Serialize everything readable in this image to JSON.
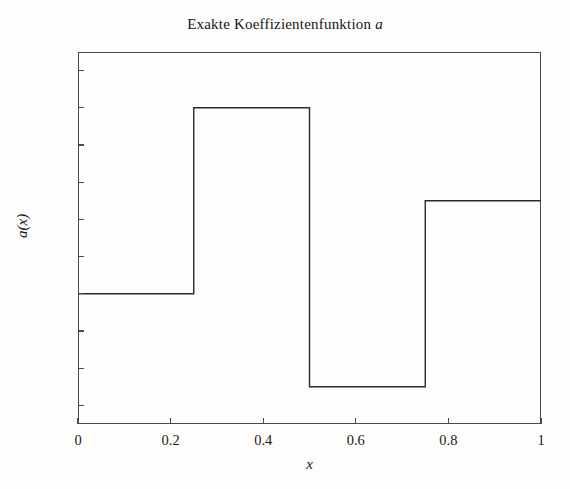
{
  "figure": {
    "title_main": "Exakte Koeffizientenfunktion",
    "title_var": "a",
    "background_color": "#fdfdfc",
    "line_color": "#2b2b2b",
    "axis_color": "#4a4a4a"
  },
  "chart_data": {
    "type": "line",
    "title": "Exakte Koeffizientenfunktion a",
    "xlabel": "x",
    "ylabel": "a(x)",
    "xlim": [
      0,
      1
    ],
    "ylim": [
      0.3,
      2.3
    ],
    "grid": false,
    "legend": null,
    "xticks": [
      0,
      0.2,
      0.4,
      0.6,
      0.8,
      1
    ],
    "xtick_labels": [
      "0",
      "0.2",
      "0.4",
      "0.6",
      "0.8",
      "1"
    ],
    "yticks": [
      0.4,
      0.6,
      0.8,
      1,
      1.2,
      1.4,
      1.6,
      1.8,
      2,
      2.2
    ],
    "ytick_labels": [
      "0.4",
      "0.6",
      "0.8",
      "1",
      "1.2",
      "1.4",
      "1.6",
      "1.8",
      "2",
      "2.2"
    ],
    "series": [
      {
        "name": "a(x)",
        "style": "step",
        "x": [
          0,
          0.25,
          0.25,
          0.5,
          0.5,
          0.75,
          0.75,
          1
        ],
        "y": [
          1.0,
          1.0,
          2.0,
          2.0,
          0.5,
          0.5,
          1.5,
          1.5
        ],
        "segments": [
          {
            "x_start": 0,
            "x_end": 0.25,
            "value": 1.0
          },
          {
            "x_start": 0.25,
            "x_end": 0.5,
            "value": 2.0
          },
          {
            "x_start": 0.5,
            "x_end": 0.75,
            "value": 0.5
          },
          {
            "x_start": 0.75,
            "x_end": 1.0,
            "value": 1.5
          }
        ]
      }
    ]
  }
}
